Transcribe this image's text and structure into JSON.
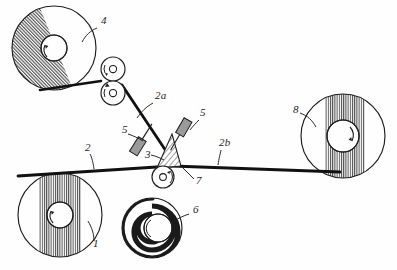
{
  "figure": {
    "background_color": "#fefefe",
    "line_color": "#1d1d1d",
    "hatch_color": "#4a4a4a",
    "web_color": "#111111"
  },
  "reference_labels": [
    {
      "id": "label-4",
      "text": "4",
      "x": 101,
      "y": 24,
      "target": "roll-4-upper-left"
    },
    {
      "id": "label-2a",
      "text": "2a",
      "x": 155,
      "y": 99,
      "target": "web-segment-2a"
    },
    {
      "id": "label-5-left",
      "text": "5",
      "x": 122,
      "y": 133,
      "target": "device-5-left"
    },
    {
      "id": "label-5-right",
      "text": "5",
      "x": 200,
      "y": 116,
      "target": "device-5-right"
    },
    {
      "id": "label-3",
      "text": "3",
      "x": 145,
      "y": 158,
      "target": "splice-wedge-3"
    },
    {
      "id": "label-2",
      "text": "2",
      "x": 85,
      "y": 151,
      "target": "web-main-2"
    },
    {
      "id": "label-2b",
      "text": "2b",
      "x": 219,
      "y": 146,
      "target": "web-segment-2b"
    },
    {
      "id": "label-7",
      "text": "7",
      "x": 196,
      "y": 184,
      "target": "nip-roller-7"
    },
    {
      "id": "label-8",
      "text": "8",
      "x": 293,
      "y": 113,
      "target": "roll-8-right"
    },
    {
      "id": "label-1",
      "text": "1",
      "x": 93,
      "y": 247,
      "target": "roll-1-lower-left"
    },
    {
      "id": "label-6",
      "text": "6",
      "x": 193,
      "y": 213,
      "target": "roll-6-lower-center"
    }
  ],
  "rolls": [
    {
      "id": "roll-4",
      "label": "4",
      "cx": 54,
      "cy": 48,
      "r": 42,
      "band_angle": -22,
      "style": "hatched-band",
      "rotation": "ccw"
    },
    {
      "id": "roll-1",
      "label": "1",
      "cx": 60,
      "cy": 215,
      "r": 42,
      "band_angle": 0,
      "style": "hatched-band",
      "rotation": "ccw"
    },
    {
      "id": "roll-8",
      "label": "8",
      "cx": 343,
      "cy": 136,
      "r": 42,
      "band_angle": 0,
      "style": "hatched-band",
      "rotation": "cw"
    },
    {
      "id": "roll-6",
      "label": "6",
      "cx": 152,
      "cy": 228,
      "r": 30,
      "band_angle": 0,
      "style": "dark-spiral",
      "rotation": "cw"
    }
  ],
  "nip_rollers": [
    {
      "id": "nip-upper",
      "cx": 113,
      "cy": 69,
      "r": 12,
      "hub_r": 3.6
    },
    {
      "id": "nip-lower",
      "cx": 113,
      "cy": 93,
      "r": 12,
      "hub_r": 3.6
    },
    {
      "id": "nip-7",
      "cx": 163,
      "cy": 177,
      "r": 11,
      "hub_r": 3.4
    }
  ],
  "devices": [
    {
      "id": "device-5-left",
      "label": "5",
      "cx": 138,
      "cy": 147,
      "angle": -58
    },
    {
      "id": "device-5-right",
      "label": "5",
      "cx": 184,
      "cy": 128,
      "angle": -60
    }
  ],
  "web_paths": {
    "main_2": "Horizontal web from roll 1 to roll 8",
    "segment_2a": "Diagonal web from nip rollers down to splice wedge",
    "segment_2b": "Horizontal web from splice wedge to roll 8"
  },
  "splice_wedge": {
    "id": "splice-wedge-3",
    "label": "3",
    "description": "Hatched triangular splice/nip wedge"
  }
}
